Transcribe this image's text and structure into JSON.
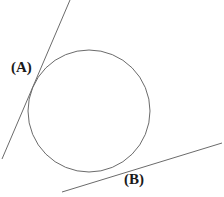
{
  "figure": {
    "background_color": "#ffffff",
    "stroke_color": "#6b6b6b",
    "label_color": "#1a1a1a",
    "stroke_width": 1,
    "labels": {
      "point_a": "(A)",
      "point_b": "(B)"
    },
    "circle": {
      "center_x": 89,
      "center_y": 111,
      "radius": 61
    },
    "tangent_line_a": {
      "x1": 70,
      "y1": 0,
      "x2": 2,
      "y2": 159
    },
    "tangent_line_b": {
      "x1": 62,
      "y1": 192,
      "x2": 222,
      "y2": 143
    }
  },
  "chart_data": {
    "type": "diagram",
    "title": "",
    "shapes": [
      {
        "kind": "circle",
        "center": [
          89,
          111
        ],
        "radius": 61,
        "stroke": "#6b6b6b",
        "fill": "none"
      },
      {
        "kind": "line",
        "name": "tangent-at-A",
        "from": [
          70,
          0
        ],
        "to": [
          2,
          159
        ],
        "stroke": "#6b6b6b",
        "tangent_point": [
          30,
          79
        ]
      },
      {
        "kind": "line",
        "name": "tangent-at-B",
        "from": [
          62,
          192
        ],
        "to": [
          222,
          143
        ],
        "stroke": "#6b6b6b",
        "tangent_point": [
          120,
          168
        ]
      }
    ],
    "annotations": [
      {
        "text": "(A)",
        "x": 11,
        "y": 59
      },
      {
        "text": "(B)",
        "x": 124,
        "y": 171
      }
    ]
  }
}
